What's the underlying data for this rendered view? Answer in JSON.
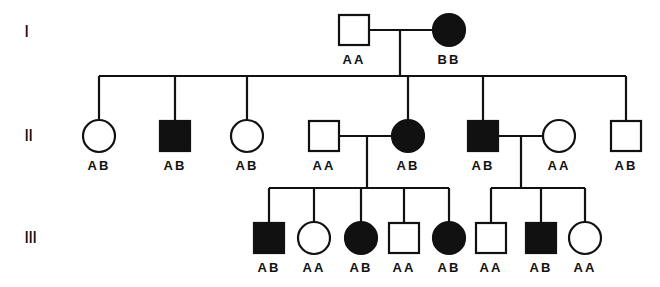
{
  "colors": {
    "ink": "#111111",
    "background": "#ffffff"
  },
  "generations": [
    {
      "label": "I",
      "y": 22
    },
    {
      "label": "II",
      "y": 126
    },
    {
      "label": "III",
      "y": 228
    }
  ],
  "individuals": [
    {
      "id": "I-1",
      "sex": "male",
      "affected": false,
      "genotype": "AA",
      "cx": 354,
      "cy": 30
    },
    {
      "id": "I-2",
      "sex": "female",
      "affected": true,
      "genotype": "BB",
      "cx": 449,
      "cy": 30
    },
    {
      "id": "II-1",
      "sex": "female",
      "affected": false,
      "genotype": "AB",
      "cx": 99,
      "cy": 136
    },
    {
      "id": "II-2",
      "sex": "male",
      "affected": true,
      "genotype": "AB",
      "cx": 175,
      "cy": 136
    },
    {
      "id": "II-3",
      "sex": "female",
      "affected": false,
      "genotype": "AB",
      "cx": 247,
      "cy": 136
    },
    {
      "id": "II-4",
      "sex": "male",
      "affected": false,
      "genotype": "AA",
      "cx": 324,
      "cy": 136
    },
    {
      "id": "II-5",
      "sex": "female",
      "affected": true,
      "genotype": "AB",
      "cx": 408,
      "cy": 136
    },
    {
      "id": "II-6",
      "sex": "male",
      "affected": true,
      "genotype": "AB",
      "cx": 483,
      "cy": 136
    },
    {
      "id": "II-7",
      "sex": "female",
      "affected": false,
      "genotype": "AA",
      "cx": 559,
      "cy": 136
    },
    {
      "id": "II-8",
      "sex": "male",
      "affected": false,
      "genotype": "AB",
      "cx": 626,
      "cy": 136
    },
    {
      "id": "III-1",
      "sex": "male",
      "affected": true,
      "genotype": "AB",
      "cx": 269,
      "cy": 238
    },
    {
      "id": "III-2",
      "sex": "female",
      "affected": false,
      "genotype": "AA",
      "cx": 314,
      "cy": 238
    },
    {
      "id": "III-3",
      "sex": "female",
      "affected": true,
      "genotype": "AB",
      "cx": 361,
      "cy": 238
    },
    {
      "id": "III-4",
      "sex": "male",
      "affected": false,
      "genotype": "AA",
      "cx": 404,
      "cy": 238
    },
    {
      "id": "III-5",
      "sex": "female",
      "affected": true,
      "genotype": "AB",
      "cx": 449,
      "cy": 238
    },
    {
      "id": "III-6",
      "sex": "male",
      "affected": false,
      "genotype": "AA",
      "cx": 491,
      "cy": 238
    },
    {
      "id": "III-7",
      "sex": "male",
      "affected": true,
      "genotype": "AB",
      "cx": 541,
      "cy": 238
    },
    {
      "id": "III-8",
      "sex": "female",
      "affected": false,
      "genotype": "AA",
      "cx": 585,
      "cy": 238
    }
  ],
  "matings": [
    {
      "partners": [
        "I-1",
        "I-2"
      ],
      "y": 30,
      "x1": 369,
      "x2": 433,
      "drop_x": 400,
      "sibship_y": 76,
      "children": [
        "II-1",
        "II-2",
        "II-3",
        "II-5",
        "II-6",
        "II-8"
      ],
      "sib_x1": 99,
      "sib_x2": 626
    },
    {
      "partners": [
        "II-4",
        "II-5"
      ],
      "y": 136,
      "x1": 340,
      "x2": 392,
      "drop_x": 367,
      "sibship_y": 188,
      "children": [
        "III-1",
        "III-2",
        "III-3",
        "III-4",
        "III-5"
      ],
      "sib_x1": 269,
      "sib_x2": 449
    },
    {
      "partners": [
        "II-6",
        "II-7"
      ],
      "y": 136,
      "x1": 498,
      "x2": 543,
      "drop_x": 521,
      "sibship_y": 188,
      "children": [
        "III-6",
        "III-7",
        "III-8"
      ],
      "sib_x1": 491,
      "sib_x2": 585
    }
  ]
}
